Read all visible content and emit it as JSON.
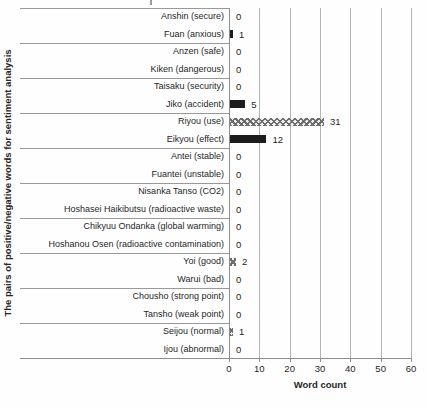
{
  "chart_data": {
    "type": "bar",
    "orientation": "horizontal",
    "title": "",
    "xlabel": "Word count",
    "ylabel": "The pairs of positive/negative words for sentiment analysis",
    "xlim": [
      0,
      60
    ],
    "x_ticks": [
      0,
      10,
      20,
      30,
      40,
      50,
      60
    ],
    "grid": true,
    "legend": "none",
    "data_labels": true,
    "colors": {
      "bar_solid": "#1c1c1c",
      "bar_pattern_foreground": "#6e6e6e",
      "gridline": "#b3b3b3",
      "axis_line": "#8c8c8c",
      "text": "#1f1f1f"
    },
    "pair_group_size": 2,
    "items": [
      {
        "label": "Anshin (secure)",
        "value": 0,
        "style": "pattern"
      },
      {
        "label": "Fuan (anxious)",
        "value": 1,
        "style": "solid"
      },
      {
        "label": "Anzen (safe)",
        "value": 0,
        "style": "pattern"
      },
      {
        "label": "Kiken (dangerous)",
        "value": 0,
        "style": "solid"
      },
      {
        "label": "Taisaku (security)",
        "value": 0,
        "style": "pattern"
      },
      {
        "label": "Jiko (accident)",
        "value": 5,
        "style": "solid"
      },
      {
        "label": "Riyou (use)",
        "value": 31,
        "style": "pattern"
      },
      {
        "label": "Eikyou (effect)",
        "value": 12,
        "style": "solid"
      },
      {
        "label": "Antei (stable)",
        "value": 0,
        "style": "pattern"
      },
      {
        "label": "Fuantei (unstable)",
        "value": 0,
        "style": "solid"
      },
      {
        "label": "Nisanka Tanso (CO2)",
        "value": 0,
        "style": "pattern"
      },
      {
        "label": "Hoshasei Haikibutsu (radioactive waste)",
        "value": 0,
        "style": "solid"
      },
      {
        "label": "Chikyuu Ondanka (global warming)",
        "value": 0,
        "style": "pattern"
      },
      {
        "label": "Hoshanou Osen (radioactive contamination)",
        "value": 0,
        "style": "solid"
      },
      {
        "label": "Yoi (good)",
        "value": 2,
        "style": "pattern"
      },
      {
        "label": "Warui (bad)",
        "value": 0,
        "style": "solid"
      },
      {
        "label": "Chousho (strong point)",
        "value": 0,
        "style": "pattern"
      },
      {
        "label": "Tansho (weak point)",
        "value": 0,
        "style": "solid"
      },
      {
        "label": "Seijou (normal)",
        "value": 1,
        "style": "pattern"
      },
      {
        "label": "Ijou (abnormal)",
        "value": 0,
        "style": "solid"
      }
    ]
  }
}
